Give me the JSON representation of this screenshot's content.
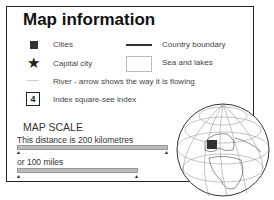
{
  "title": "Map information",
  "legend": {
    "cities": "Cities",
    "capital": "Capital city",
    "river": "River - arrow shows the way it is flowing",
    "index": "Index square-see index",
    "index_number": "4",
    "country_boundary": "Country boundary",
    "sea": "Sea and lakes"
  },
  "scale": {
    "title": "MAP SCALE",
    "km": "This distance is 200 kilometres",
    "miles": "or 100 miles"
  }
}
